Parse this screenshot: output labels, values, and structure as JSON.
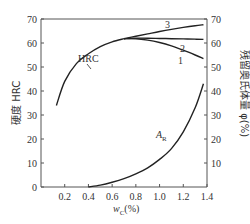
{
  "chart_data": {
    "type": "line",
    "title": "",
    "xlabel": "wC(%)",
    "ylabel_left": "硬度 HRC",
    "ylabel_right": "残留奥氏体量 φ(%)",
    "xlim": [
      0,
      1.4
    ],
    "ylim_left": [
      0,
      70
    ],
    "ylim_right": [
      0,
      70
    ],
    "x_ticks": [
      "0.2",
      "0.4",
      "0.6",
      "0.8",
      "1.0",
      "1.2",
      "1.4"
    ],
    "y_ticks_left": [
      "0",
      "10",
      "20",
      "30",
      "40",
      "50",
      "60",
      "70"
    ],
    "y_ticks_right": [
      "10",
      "20",
      "30",
      "40",
      "50",
      "60",
      "70"
    ],
    "grid": false,
    "series": [
      {
        "name": "HRC",
        "axis": "left",
        "x": [
          0.13,
          0.2,
          0.3,
          0.4,
          0.5,
          0.6,
          0.7
        ],
        "values": [
          34,
          44,
          51.5,
          55.5,
          58.5,
          60.5,
          61.8
        ]
      },
      {
        "name": "1",
        "axis": "left",
        "x": [
          0.7,
          0.8,
          0.9,
          1.0,
          1.1,
          1.2,
          1.3,
          1.37
        ],
        "values": [
          61.8,
          61.8,
          61.2,
          60.2,
          58.8,
          57.0,
          55.0,
          53.5
        ]
      },
      {
        "name": "2",
        "axis": "left",
        "x": [
          0.7,
          0.8,
          0.9,
          1.0,
          1.1,
          1.2,
          1.3,
          1.37
        ],
        "values": [
          61.8,
          62.0,
          62.0,
          61.9,
          61.8,
          61.7,
          61.6,
          61.5
        ]
      },
      {
        "name": "3",
        "axis": "left",
        "x": [
          0.7,
          0.8,
          0.9,
          1.0,
          1.1,
          1.2,
          1.3,
          1.37
        ],
        "values": [
          61.8,
          62.8,
          63.8,
          64.8,
          65.7,
          66.5,
          67.2,
          67.6
        ]
      },
      {
        "name": "AR",
        "axis": "right",
        "x": [
          0.4,
          0.5,
          0.6,
          0.7,
          0.8,
          0.9,
          1.0,
          1.1,
          1.2,
          1.3,
          1.37
        ],
        "values": [
          0,
          0.8,
          2.0,
          3.5,
          5.5,
          8.0,
          11.5,
          16.0,
          23.0,
          33.0,
          43.0
        ]
      }
    ],
    "annotations": [
      "HRC",
      "1",
      "2",
      "3",
      "AR"
    ]
  },
  "labels": {
    "hrc": "HRC",
    "c1": "1",
    "c2": "2",
    "c3": "3",
    "ar_main": "A",
    "ar_sub": "R",
    "x_axis_main": "w",
    "x_axis_sub": "C",
    "x_axis_unit": "(%)",
    "y_left": "硬度  HRC",
    "y_right": "残留奥氏体量 φ(%)"
  }
}
